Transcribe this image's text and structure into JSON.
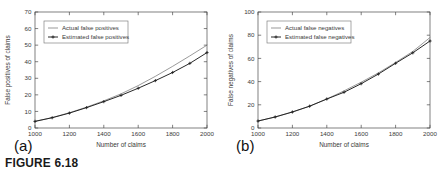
{
  "figure": {
    "caption": "FIGURE 6.18",
    "panel_a_label": "(a)",
    "panel_b_label": "(b)"
  },
  "colors": {
    "background": "#ffffff",
    "axis": "#4a4a4a",
    "text": "#3a3a3a",
    "actual_line": "#6e6e6e",
    "estimated_line": "#1c1c1c",
    "legend_border": "#7a7a7a"
  },
  "chart_data": [
    {
      "type": "line",
      "panel": "(a)",
      "title": "",
      "xlabel": "Number of claims",
      "ylabel": "False positives of claims",
      "xlim": [
        1000,
        2000
      ],
      "ylim": [
        0,
        70
      ],
      "xticks": [
        1000,
        1200,
        1400,
        1600,
        1800,
        2000
      ],
      "yticks": [
        0,
        10,
        20,
        30,
        40,
        50,
        60,
        70
      ],
      "xtick_labels": [
        "1000",
        "1200",
        "1400",
        "1600",
        "1800",
        "2000"
      ],
      "ytick_labels": [
        "0",
        "10",
        "20",
        "30",
        "40",
        "50",
        "60",
        "70"
      ],
      "grid": false,
      "legend_position": "upper left",
      "x": [
        1000,
        1100,
        1200,
        1300,
        1400,
        1500,
        1600,
        1700,
        1800,
        1900,
        2000
      ],
      "series": [
        {
          "name": "Actual false positives",
          "marker": "none",
          "values": [
            4.0,
            6.3,
            9.2,
            12.6,
            16.4,
            20.6,
            25.6,
            31.2,
            37.2,
            43.5,
            50.0
          ]
        },
        {
          "name": "Estimated false positives",
          "marker": "plus",
          "values": [
            4.0,
            6.2,
            9.0,
            12.3,
            15.9,
            19.7,
            24.0,
            28.6,
            33.5,
            39.0,
            45.5
          ]
        }
      ]
    },
    {
      "type": "line",
      "panel": "(b)",
      "title": "",
      "xlabel": "Number of claims",
      "ylabel": "False negatives of claims",
      "xlim": [
        1000,
        2000
      ],
      "ylim": [
        0,
        100
      ],
      "xticks": [
        1000,
        1200,
        1400,
        1600,
        1800,
        2000
      ],
      "yticks": [
        0,
        20,
        40,
        60,
        80,
        100
      ],
      "xtick_labels": [
        "1000",
        "1200",
        "1400",
        "1600",
        "1800",
        "2000"
      ],
      "ytick_labels": [
        "0",
        "20",
        "40",
        "60",
        "80",
        "100"
      ],
      "grid": false,
      "legend_position": "upper left",
      "x": [
        1000,
        1100,
        1200,
        1300,
        1400,
        1500,
        1600,
        1700,
        1800,
        1900,
        2000
      ],
      "series": [
        {
          "name": "Actual false negatives",
          "marker": "none",
          "values": [
            6.0,
            9.5,
            13.8,
            18.8,
            25.0,
            32.0,
            39.5,
            47.5,
            56.5,
            66.0,
            78.0
          ]
        },
        {
          "name": "Estimated false negatives",
          "marker": "plus",
          "values": [
            6.0,
            9.5,
            13.8,
            18.8,
            25.0,
            30.8,
            38.2,
            46.5,
            55.8,
            64.8,
            75.0
          ]
        }
      ]
    }
  ]
}
